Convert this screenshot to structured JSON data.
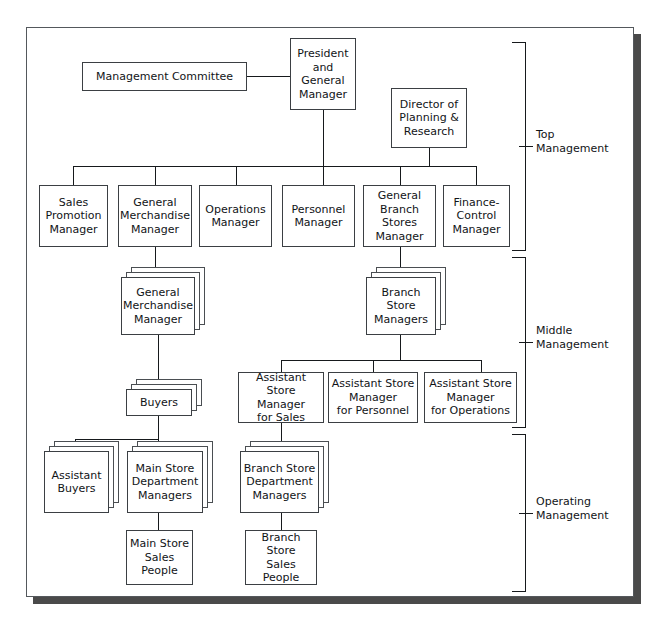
{
  "chart": {
    "type": "org-chart",
    "nodes": {
      "management_committee": "Management Committee",
      "president": "President\nand\nGeneral\nManager",
      "director_planning": "Director of\nPlanning &\nResearch",
      "sales_promotion_manager": "Sales\nPromotion\nManager",
      "general_merchandise_manager": "General\nMerchandise\nManager",
      "operations_manager": "Operations\nManager",
      "personnel_manager": "Personnel\nManager",
      "general_branch_stores_manager": "General\nBranch\nStores\nManager",
      "finance_control_manager": "Finance-\nControl\nManager",
      "general_merchandise_manager_mid": "General\nMerchandise\nManager",
      "branch_store_managers": "Branch\nStore\nManagers",
      "buyers": "Buyers",
      "asm_sales": "Assistant Store\nManager\nfor Sales",
      "asm_personnel": "Assistant Store\nManager\nfor Personnel",
      "asm_operations": "Assistant Store\nManager\nfor Operations",
      "assistant_buyers": "Assistant\nBuyers",
      "main_store_dept_managers": "Main Store\nDepartment\nManagers",
      "branch_store_dept_managers": "Branch Store\nDepartment\nManagers",
      "main_store_sales_people": "Main Store\nSales\nPeople",
      "branch_store_sales_people": "Branch Store\nSales\nPeople"
    },
    "brackets": [
      {
        "id": "top",
        "label": "Top\nManagement"
      },
      {
        "id": "middle",
        "label": "Middle\nManagement"
      },
      {
        "id": "operating",
        "label": "Operating\nManagement"
      }
    ],
    "colors": {
      "box_border": "#3b3f43",
      "connector": "#16191c",
      "frame_border": "#54585c",
      "frame_shadow": "#4a4a4a",
      "background": "#ffffff",
      "text": "#111417"
    }
  }
}
